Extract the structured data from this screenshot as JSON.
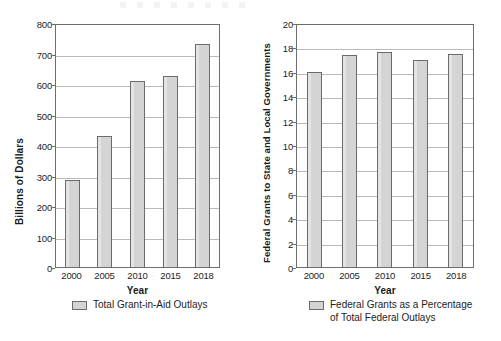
{
  "chart_data": [
    {
      "type": "bar",
      "id": "total-grant-in-aid-outlays",
      "title": "",
      "xlabel": "Year",
      "ylabel": "Billions of Dollars",
      "categories": [
        "2000",
        "2005",
        "2010",
        "2015",
        "2018"
      ],
      "values": [
        285,
        428,
        610,
        625,
        730
      ],
      "ylim": [
        0,
        800
      ],
      "ytick_step": 100,
      "yticks": [
        "800",
        "700",
        "600",
        "500",
        "400",
        "300",
        "200",
        "100",
        "0"
      ],
      "grid": true,
      "legend": [
        "Total Grant-in-Aid Outlays"
      ],
      "legend_position": "bottom",
      "bar_color": "#d4d4d4",
      "bar_border_color": "#6b6b6b"
    },
    {
      "type": "bar",
      "id": "federal-grants-percentage",
      "title": "",
      "xlabel": "Year",
      "ylabel": "Federal Grants to State and Local Governments",
      "categories": [
        "2000",
        "2005",
        "2010",
        "2015",
        "2018"
      ],
      "values": [
        16.0,
        17.35,
        17.65,
        17.0,
        17.5
      ],
      "ylim": [
        0,
        20
      ],
      "ytick_step": 2,
      "yticks": [
        "20",
        "18",
        "16",
        "14",
        "12",
        "10",
        "8",
        "6",
        "4",
        "2",
        "0"
      ],
      "grid": true,
      "legend": [
        "Federal Grants as a Percentage of Total Federal Outlays"
      ],
      "legend_position": "bottom",
      "bar_color": "#d4d4d4",
      "bar_border_color": "#6b6b6b"
    }
  ],
  "left": {
    "ylabel": "Billions of Dollars",
    "xlabel": "Year",
    "yticks": [
      "800",
      "700",
      "600",
      "500",
      "400",
      "300",
      "200",
      "100",
      "0"
    ],
    "xticks": [
      "2000",
      "2005",
      "2010",
      "2015",
      "2018"
    ],
    "legend_label": "Total Grant-in-Aid Outlays"
  },
  "right": {
    "ylabel": "Federal Grants to State and Local Governments",
    "xlabel": "Year",
    "yticks": [
      "20",
      "18",
      "16",
      "14",
      "12",
      "10",
      "8",
      "6",
      "4",
      "2",
      "0"
    ],
    "xticks": [
      "2000",
      "2005",
      "2010",
      "2015",
      "2018"
    ],
    "legend_label_line1": "Federal Grants as a Percentage",
    "legend_label_line2": "of Total Federal Outlays"
  }
}
